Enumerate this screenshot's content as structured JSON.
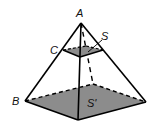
{
  "figure": {
    "type": "truncated pyramid cross-section",
    "labels": {
      "apex": "A",
      "section_corner": "C",
      "base_corner": "B",
      "section_area": "S",
      "base_area": "S'"
    },
    "colors": {
      "fill": "#8c8c8c",
      "stroke": "#000000",
      "background": "#ffffff"
    }
  }
}
